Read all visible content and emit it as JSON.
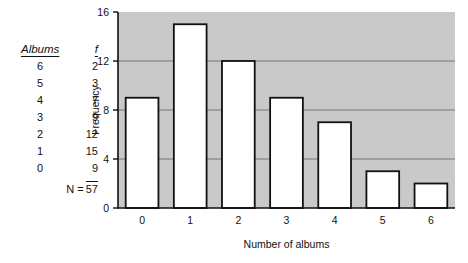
{
  "table": {
    "headers": [
      "Albums",
      "f"
    ],
    "rows": [
      {
        "album": "6",
        "f": "2"
      },
      {
        "album": "5",
        "f": "3"
      },
      {
        "album": "4",
        "f": "7"
      },
      {
        "album": "3",
        "f": "9"
      },
      {
        "album": "2",
        "f": "12"
      },
      {
        "album": "1",
        "f": "15"
      },
      {
        "album": "0",
        "f": "9"
      }
    ],
    "total_label": "N =",
    "total_value": "57"
  },
  "chart_data": {
    "type": "bar",
    "title": "",
    "xlabel": "Number of albums",
    "ylabel": "Frequency",
    "categories": [
      "0",
      "1",
      "2",
      "3",
      "4",
      "5",
      "6"
    ],
    "values": [
      9,
      15,
      12,
      9,
      7,
      3,
      2
    ],
    "xlim": [
      0,
      7
    ],
    "ylim": [
      0,
      16
    ],
    "yticks": [
      0,
      4,
      8,
      12,
      16
    ],
    "ytick_labels": [
      "0",
      "4",
      "8",
      "12",
      "16"
    ],
    "grid": true,
    "grid_axis": "y",
    "legend": false,
    "plot_background": "#c9c9c9",
    "bar_fill": "#ffffff",
    "bar_edge": "#111111"
  }
}
